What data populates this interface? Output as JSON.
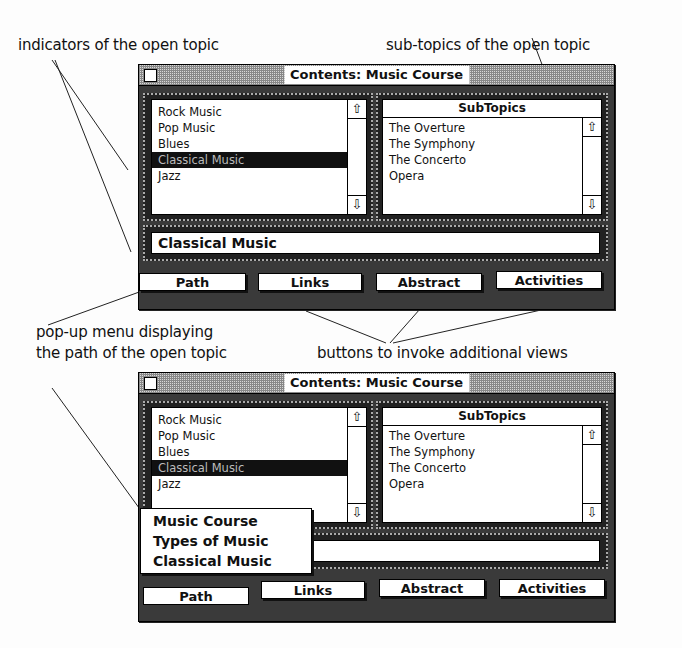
{
  "annotations": {
    "indicators": "indicators of the open topic",
    "subtopics": "sub-topics of the open topic",
    "popup_line1": "pop-up menu displaying",
    "popup_line2": "the path of the open topic",
    "buttons": "buttons to invoke additional views"
  },
  "windows": [
    {
      "title": "Contents: Music Course",
      "topics": [
        "Rock Music",
        "Pop Music",
        "Blues",
        "Classical Music",
        "Jazz"
      ],
      "selected_index": 3,
      "subtopics_header": "SubTopics",
      "subtopics": [
        "The Overture",
        "The Symphony",
        "The Concerto",
        "Opera"
      ],
      "path_field": "Classical Music",
      "buttons": [
        "Path",
        "Links",
        "Abstract",
        "Activities"
      ]
    },
    {
      "title": "Contents: Music Course",
      "topics": [
        "Rock Music",
        "Pop Music",
        "Blues",
        "Classical Music",
        "Jazz"
      ],
      "selected_index": 3,
      "subtopics_header": "SubTopics",
      "subtopics": [
        "The Overture",
        "The Symphony",
        "The Concerto",
        "Opera"
      ],
      "path_field": "",
      "buttons": [
        "Path",
        "Links",
        "Abstract",
        "Activities"
      ],
      "popup_menu": [
        "Music Course",
        "Types of Music",
        "Classical Music"
      ]
    }
  ],
  "icons": {
    "scroll_up": "⇧",
    "scroll_down": "⇩"
  }
}
